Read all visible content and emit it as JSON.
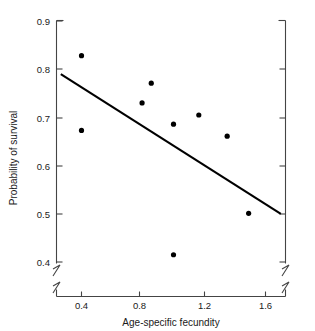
{
  "chart_data": {
    "type": "scatter",
    "title": "",
    "xlabel": "Age-specific fecundity",
    "ylabel": "Probability of survival",
    "xlim": [
      0.2,
      1.78
    ],
    "ylim": [
      0.375,
      0.9
    ],
    "grid": false,
    "legend": null,
    "axis_break": {
      "axis": "y",
      "below": 0.4
    },
    "xticks": [
      0.4,
      0.8,
      1.2,
      1.6
    ],
    "xtick_labels": [
      "0.4",
      "0.8",
      "1.2",
      "1.6"
    ],
    "yticks": [
      0.4,
      0.5,
      0.6,
      0.7,
      0.8,
      0.9
    ],
    "ytick_labels": [
      "0.4",
      "0.5",
      "0.6",
      "0.7",
      "0.8",
      "0.9"
    ],
    "points": [
      {
        "x": 0.4,
        "y": 0.828
      },
      {
        "x": 0.4,
        "y": 0.673
      },
      {
        "x": 0.795,
        "y": 0.73
      },
      {
        "x": 0.855,
        "y": 0.771
      },
      {
        "x": 1.0,
        "y": 0.686
      },
      {
        "x": 1.0,
        "y": 0.415
      },
      {
        "x": 1.165,
        "y": 0.705
      },
      {
        "x": 1.35,
        "y": 0.661
      },
      {
        "x": 1.49,
        "y": 0.501
      }
    ],
    "marker": {
      "shape": "circle",
      "size": 5.2,
      "color": "#000000"
    },
    "fit_line": {
      "type": "linear",
      "x0": 0.265,
      "y0": 0.79,
      "x1": 1.7,
      "y1": 0.5,
      "color": "#000000",
      "width": 2.1
    },
    "axis_color": "#444444"
  }
}
